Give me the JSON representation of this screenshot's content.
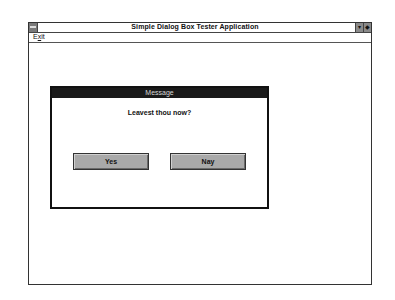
{
  "window": {
    "title": "Simple Dialog Box Tester Application",
    "sysmenu_icon": "system-menu-icon",
    "minimize_glyph": "▾",
    "maximize_glyph": "◆"
  },
  "menubar": {
    "items": [
      {
        "label_prefix": "E",
        "label_underlined": "x",
        "label_suffix": "it"
      }
    ]
  },
  "dialog": {
    "title": "Message",
    "message": "Leavest thou now?",
    "buttons": {
      "yes": "Yes",
      "nay": "Nay"
    }
  },
  "colors": {
    "dialog_title_bg": "#1a1a1a",
    "button_face": "#a9a9a9",
    "window_bg": "#ffffff"
  }
}
